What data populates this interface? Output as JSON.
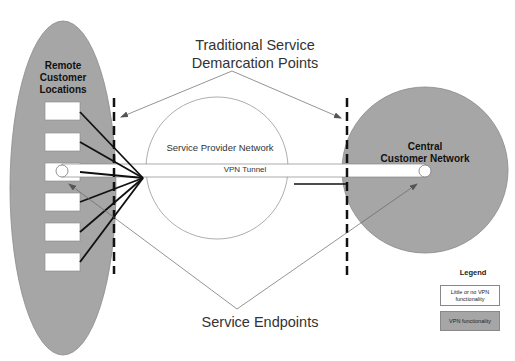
{
  "diagram": {
    "title_top_line1": "Traditional Service",
    "title_top_line2": "Demarcation Points",
    "title_bottom": "Service Endpoints",
    "remote": {
      "label_line1": "Remote",
      "label_line2": "Customer",
      "label_line3": "Locations",
      "site_count": 6
    },
    "central": {
      "label_line1": "Central",
      "label_line2": "Customer Network"
    },
    "service_provider_label": "Service Provider Network",
    "tunnel_label": "VPN Tunnel",
    "legend": {
      "title": "Legend",
      "items": [
        {
          "label_line1": "Little or no VPN",
          "label_line2": "functionality",
          "color": "#ffffff"
        },
        {
          "label_line1": "VPN functionality",
          "label_line2": "",
          "color": "#a6a6a6"
        }
      ]
    },
    "colors": {
      "customer_fill": "#a6a6a6",
      "line": "#111111",
      "thin_line": "#888888"
    }
  }
}
